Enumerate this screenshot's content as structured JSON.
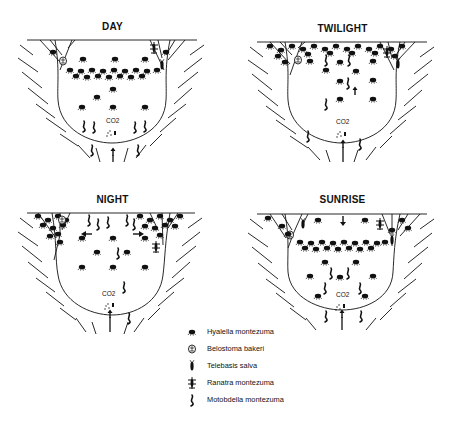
{
  "figure": {
    "panels": [
      {
        "id": "day",
        "title": "DAY",
        "co2_label": "CO2"
      },
      {
        "id": "twilight",
        "title": "TWILIGHT",
        "co2_label": "CO2"
      },
      {
        "id": "night",
        "title": "NIGHT",
        "co2_label": "CO2"
      },
      {
        "id": "sunrise",
        "title": "SUNRISE",
        "co2_label": "CO2"
      }
    ],
    "legend": [
      {
        "icon": "amphipod-icon",
        "label": "Hyalella montezuma"
      },
      {
        "icon": "water-bug-icon",
        "label": "Belostoma bakeri"
      },
      {
        "icon": "damselfly-larva-icon",
        "label": "Telebasis salva"
      },
      {
        "icon": "water-scorpion-icon",
        "label": "Ranatra montezuma"
      },
      {
        "icon": "leech-icon",
        "label": "Motobdella montezuma"
      }
    ]
  }
}
